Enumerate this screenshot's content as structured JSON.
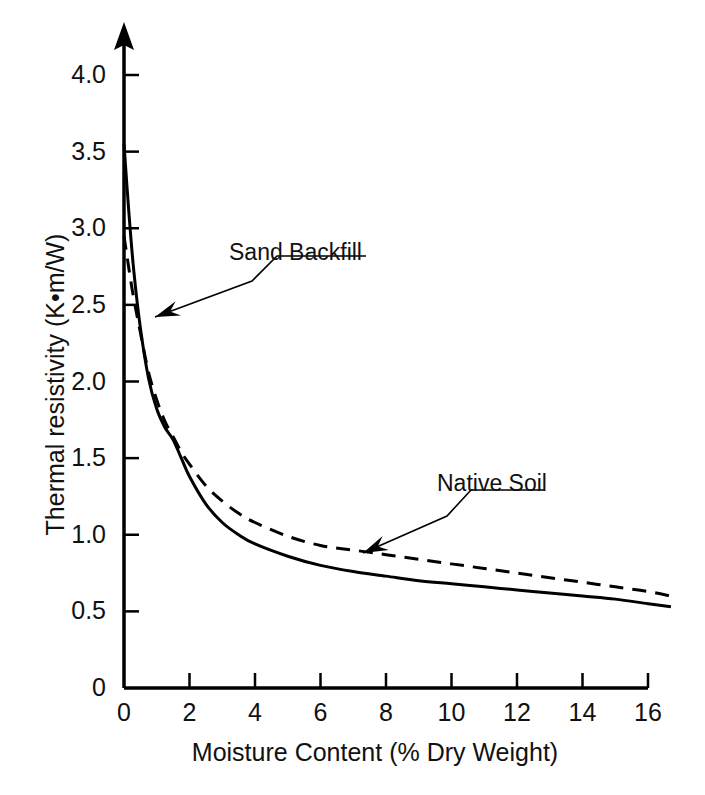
{
  "figure": {
    "background": "#ffffff",
    "ink_color": "#000000"
  },
  "chart_data": {
    "type": "line",
    "title": "",
    "xlabel": "Moisture Content (% Dry Weight)",
    "ylabel": "Thermal resistivity (K•m/W)",
    "xlim": [
      0,
      16.8
    ],
    "ylim": [
      0,
      4.3
    ],
    "xticks": [
      0,
      2,
      4,
      6,
      8,
      10,
      12,
      14,
      16
    ],
    "xtick_labels": [
      "0",
      "2",
      "4",
      "6",
      "8",
      "10",
      "12",
      "14",
      "16"
    ],
    "yticks": [
      0,
      0.5,
      1.0,
      1.5,
      2.0,
      2.5,
      3.0,
      3.5,
      4.0
    ],
    "ytick_labels": [
      "0",
      "0.5",
      "1.0",
      "1.5",
      "2.0",
      "2.5",
      "3.0",
      "3.5",
      "4.0"
    ],
    "grid": false,
    "legend": "none",
    "y_axis_arrow": true,
    "series": [
      {
        "name": "Sand Backfill",
        "style": "solid",
        "color": "#000000",
        "linewidth": 3,
        "x": [
          0.0,
          0.15,
          0.3,
          0.5,
          0.75,
          1.0,
          1.25,
          1.5,
          1.75,
          2.0,
          2.5,
          3.0,
          3.5,
          4.0,
          5.0,
          6.0,
          7.0,
          8.0,
          9.0,
          10.0,
          11.0,
          12.0,
          13.0,
          14.0,
          15.0,
          16.0,
          16.7
        ],
        "y": [
          3.55,
          3.1,
          2.72,
          2.35,
          2.02,
          1.82,
          1.7,
          1.62,
          1.5,
          1.38,
          1.2,
          1.08,
          1.0,
          0.94,
          0.86,
          0.8,
          0.76,
          0.73,
          0.7,
          0.68,
          0.66,
          0.64,
          0.62,
          0.6,
          0.58,
          0.55,
          0.53
        ]
      },
      {
        "name": "Native Soil",
        "style": "dashed",
        "color": "#000000",
        "linewidth": 3,
        "dash_pattern": "14 9",
        "x": [
          0.0,
          0.25,
          0.5,
          0.75,
          1.0,
          1.25,
          1.5,
          1.75,
          2.0,
          2.5,
          3.0,
          3.5,
          4.0,
          5.0,
          6.0,
          7.0,
          8.0,
          9.0,
          10.0,
          11.0,
          12.0,
          13.0,
          14.0,
          15.0,
          16.0,
          16.7
        ],
        "y": [
          2.95,
          2.6,
          2.32,
          2.06,
          1.88,
          1.74,
          1.64,
          1.54,
          1.46,
          1.32,
          1.22,
          1.14,
          1.08,
          0.99,
          0.93,
          0.9,
          0.87,
          0.84,
          0.81,
          0.78,
          0.75,
          0.72,
          0.69,
          0.66,
          0.63,
          0.6
        ]
      }
    ],
    "annotations": [
      {
        "name": "sand-backfill",
        "text": "Sand Backfill",
        "label_x": 229,
        "label_y": 239,
        "leader": [
          [
            366,
            256
          ],
          [
            277,
            256
          ],
          [
            252,
            281
          ],
          [
            155,
            317
          ]
        ],
        "target_series": "Sand Backfill"
      },
      {
        "name": "native-soil",
        "text": "Native Soil",
        "label_x": 437,
        "label_y": 470,
        "leader": [
          [
            545,
            490
          ],
          [
            471,
            490
          ],
          [
            447,
            516
          ],
          [
            363,
            553
          ]
        ],
        "target_series": "Native Soil"
      }
    ]
  }
}
